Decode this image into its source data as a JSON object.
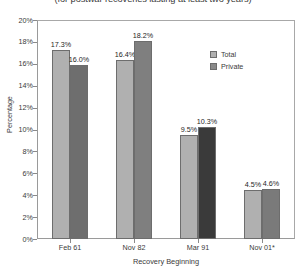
{
  "chart_data": {
    "type": "bar",
    "title": "(for postwar recoveries lasting at least two years)",
    "xlabel": "Recovery Beginning",
    "ylabel": "Percentage",
    "ylim": [
      0,
      20
    ],
    "ytick_labels": [
      "20%",
      "18%",
      "16%",
      "14%",
      "12%",
      "10%",
      "8%",
      "6%",
      "4%",
      "2%",
      "0%"
    ],
    "ytick_values": [
      20,
      18,
      16,
      14,
      12,
      10,
      8,
      6,
      4,
      2,
      0
    ],
    "grid": false,
    "legend_position": "inside-top-right",
    "categories": [
      "Feb 61",
      "Nov 82",
      "Mar 91",
      "Nov 01*"
    ],
    "series": [
      {
        "name": "Total",
        "color": "#b0b0b0",
        "values": [
          17.3,
          16.4,
          9.5,
          4.5
        ],
        "labels": [
          "17.3%",
          "16.4%",
          "9.5%",
          "4.5%"
        ]
      },
      {
        "name": "Private",
        "color": "#8a8a8a",
        "values": [
          16.0,
          18.2,
          10.3,
          4.6
        ],
        "labels": [
          "16.0%",
          "18.2%",
          "10.3%",
          "4.6%"
        ],
        "bar_colors": [
          "#6e6e6e",
          "#7f7f7f",
          "#3a3a3a",
          "#7a7a7a"
        ]
      }
    ]
  },
  "legend": {
    "items": [
      {
        "label": "Total",
        "color": "#b0b0b0"
      },
      {
        "label": "Private",
        "color": "#8a8a8a"
      }
    ]
  }
}
